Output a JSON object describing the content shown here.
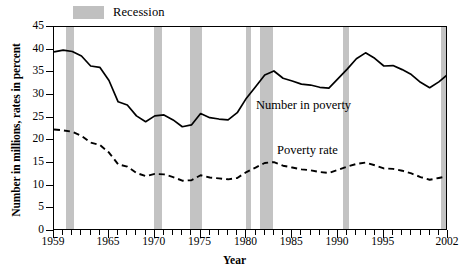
{
  "legend": {
    "label": "Recession",
    "swatch_color": "#c3c3c3"
  },
  "axes": {
    "ylabel": "Number in millions, rates in percent",
    "xlabel": "Year",
    "yticks": [
      0,
      5,
      10,
      15,
      20,
      25,
      30,
      35,
      40,
      45
    ],
    "xtick_labels": [
      "1959",
      "1965",
      "1970",
      "1975",
      "1980",
      "1985",
      "1990",
      "1995",
      "2002"
    ]
  },
  "annotations": {
    "number_in_poverty": "Number in poverty",
    "poverty_rate": "Poverty rate"
  },
  "chart_data": {
    "type": "line",
    "title": "",
    "xlabel": "Year",
    "ylabel": "Number in millions, rates in percent",
    "xlim": [
      1959,
      2002
    ],
    "ylim": [
      0,
      45
    ],
    "grid": false,
    "legend_position": "top-left",
    "x": [
      1959,
      1960,
      1961,
      1962,
      1963,
      1964,
      1965,
      1966,
      1967,
      1968,
      1969,
      1970,
      1971,
      1972,
      1973,
      1974,
      1975,
      1976,
      1977,
      1978,
      1979,
      1980,
      1981,
      1982,
      1983,
      1984,
      1985,
      1986,
      1987,
      1988,
      1989,
      1990,
      1991,
      1992,
      1993,
      1994,
      1995,
      1996,
      1997,
      1998,
      1999,
      2000,
      2001,
      2002
    ],
    "series": [
      {
        "name": "Number in poverty",
        "style": "solid",
        "color": "#000000",
        "unit": "millions",
        "values": [
          39.5,
          39.9,
          39.6,
          38.6,
          36.4,
          36.1,
          33.2,
          28.5,
          27.8,
          25.4,
          24.1,
          25.4,
          25.6,
          24.5,
          23.0,
          23.4,
          25.9,
          25.0,
          24.7,
          24.5,
          26.1,
          29.3,
          31.8,
          34.4,
          35.3,
          33.7,
          33.1,
          32.4,
          32.2,
          31.7,
          31.5,
          33.6,
          35.7,
          38.0,
          39.3,
          38.1,
          36.4,
          36.5,
          35.6,
          34.5,
          32.8,
          31.6,
          32.9,
          34.6
        ]
      },
      {
        "name": "Poverty rate",
        "style": "dashed",
        "color": "#000000",
        "unit": "percent",
        "values": [
          22.4,
          22.2,
          21.9,
          21.0,
          19.5,
          19.0,
          17.3,
          14.7,
          14.2,
          12.8,
          12.1,
          12.6,
          12.5,
          11.9,
          11.1,
          11.2,
          12.3,
          11.8,
          11.6,
          11.4,
          11.7,
          13.0,
          14.0,
          15.0,
          15.2,
          14.4,
          14.0,
          13.6,
          13.4,
          13.0,
          12.8,
          13.5,
          14.2,
          14.8,
          15.1,
          14.5,
          13.8,
          13.7,
          13.3,
          12.7,
          11.9,
          11.3,
          11.7,
          12.1
        ]
      }
    ],
    "recessions": [
      {
        "start": 1960.3,
        "end": 1961.2
      },
      {
        "start": 1969.9,
        "end": 1970.8
      },
      {
        "start": 1973.8,
        "end": 1975.2
      },
      {
        "start": 1980.0,
        "end": 1980.5
      },
      {
        "start": 1981.5,
        "end": 1982.9
      },
      {
        "start": 1990.5,
        "end": 1991.2
      },
      {
        "start": 2001.2,
        "end": 2001.9
      }
    ]
  }
}
